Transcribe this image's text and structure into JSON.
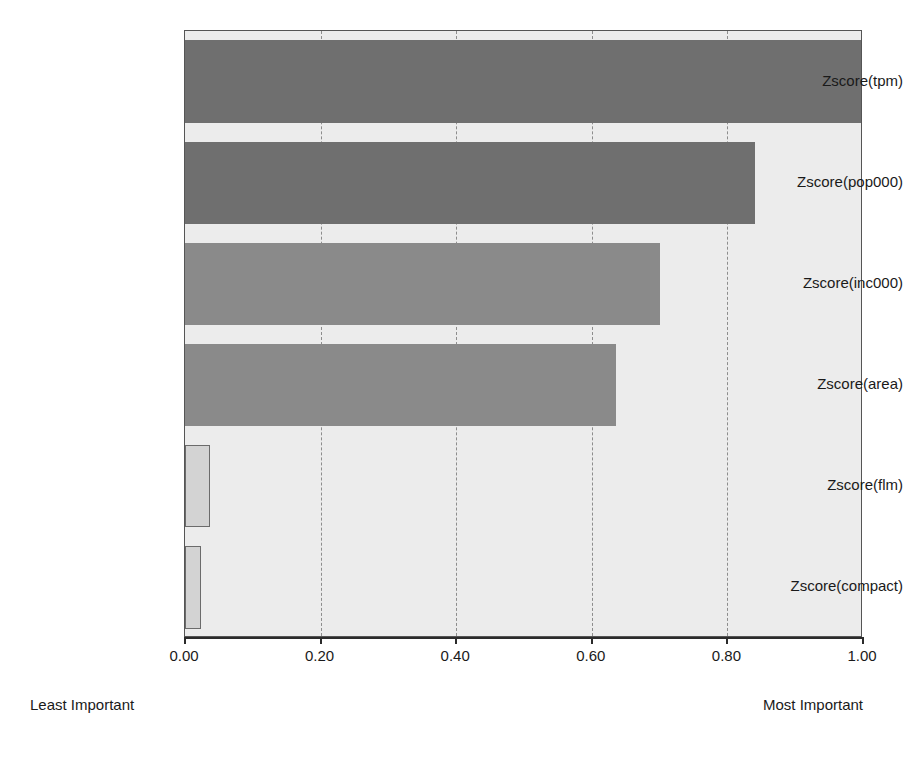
{
  "chart_data": {
    "type": "bar",
    "orientation": "horizontal",
    "title": "",
    "subtitle": "",
    "xlabel": "",
    "ylabel": "",
    "categories": [
      "Zscore(tpm)",
      "Zscore(pop000)",
      "Zscore(inc000)",
      "Zscore(area)",
      "Zscore(flm)",
      "Zscore(compact)"
    ],
    "values": [
      1.0,
      0.84,
      0.7,
      0.635,
      0.037,
      0.024
    ],
    "series": [
      {
        "name": "Importance",
        "values": [
          1.0,
          0.84,
          0.7,
          0.635,
          0.037,
          0.024
        ]
      }
    ],
    "xlim": [
      0.0,
      1.0
    ],
    "xticks": [
      0.0,
      0.2,
      0.4,
      0.6,
      0.8,
      1.0
    ],
    "xticklabels": [
      "0.00",
      "0.20",
      "0.40",
      "0.60",
      "0.80",
      "1.00"
    ],
    "grid": "vertical-dashed",
    "legend": "none",
    "annotations": {
      "left": "Least Important",
      "right": "Most Important"
    },
    "bar_styles": [
      "dark",
      "dark",
      "mid",
      "mid",
      "light",
      "light"
    ],
    "colors": {
      "bar_dark": "#6f6f6f",
      "bar_mid": "#8a8a8a",
      "bar_light": "#d3d3d3",
      "bar_light_outline": "#6b6b6b",
      "plot_background": "#ececec",
      "axis": "#2b2b2b",
      "gridline": "#8d8d8d",
      "text": "#1a1a1a"
    }
  }
}
